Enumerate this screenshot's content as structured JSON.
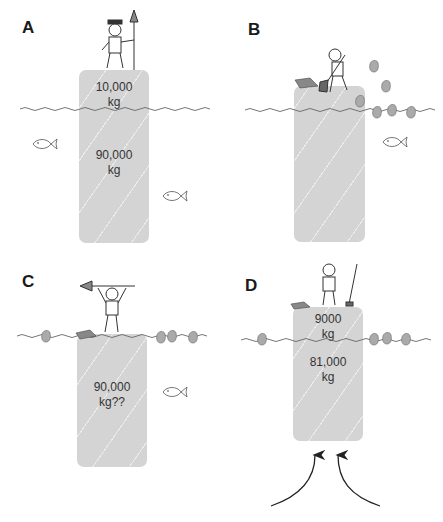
{
  "panels": [
    {
      "label": "A",
      "above_water": "10,000 kg",
      "above_line1": "10,000",
      "above_line2": "kg",
      "below_line1": "90,000",
      "below_line2": "kg"
    },
    {
      "label": "B"
    },
    {
      "label": "C",
      "below_line1": "90,000",
      "below_line2": "kg??"
    },
    {
      "label": "D",
      "above_line1": "9000",
      "above_line2": "kg",
      "below_line1": "81,000",
      "below_line2": "kg"
    }
  ],
  "colors": {
    "ice": "#d4d4d4",
    "rock": "#a9a9a9",
    "line": "#555555",
    "arrow": "#222222"
  },
  "icons": [
    "person-with-shovel-icon",
    "fish-icon",
    "rock-icon",
    "upward-arrow-icon"
  ]
}
